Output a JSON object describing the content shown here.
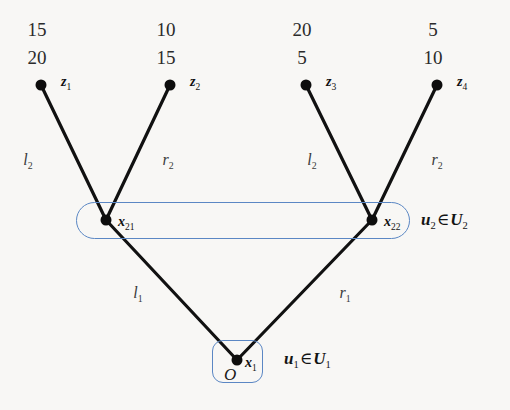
{
  "figure": {
    "background_color": "#f8f7f5",
    "edge_color": "#111111",
    "node_color": "#0d0d0d",
    "group_outline_color": "#5b87c4"
  },
  "leaves": [
    {
      "id": "z1",
      "name": "z",
      "index": "1",
      "x": 41,
      "y": 85,
      "weight_top": "15",
      "weight_bottom": "20"
    },
    {
      "id": "z2",
      "name": "z",
      "index": "2",
      "x": 170,
      "y": 85,
      "weight_top": "10",
      "weight_bottom": "15"
    },
    {
      "id": "z3",
      "name": "z",
      "index": "3",
      "x": 306,
      "y": 85,
      "weight_top": "20",
      "weight_bottom": "5"
    },
    {
      "id": "z4",
      "name": "z",
      "index": "4",
      "x": 437,
      "y": 85,
      "weight_top": "5",
      "weight_bottom": "10"
    }
  ],
  "inner_nodes": [
    {
      "id": "x21",
      "name": "x",
      "index": "21",
      "x": 106,
      "y": 220
    },
    {
      "id": "x22",
      "name": "x",
      "index": "22",
      "x": 372,
      "y": 220
    }
  ],
  "root": {
    "id": "x1",
    "name": "x",
    "index": "1",
    "origin_label": "O",
    "x": 237,
    "y": 360
  },
  "edge_labels": [
    {
      "id": "l2-a",
      "name": "l",
      "index": "2",
      "x": 28,
      "y": 152
    },
    {
      "id": "r2-a",
      "name": "r",
      "index": "2",
      "x": 168,
      "y": 152
    },
    {
      "id": "l2-b",
      "name": "l",
      "index": "2",
      "x": 312,
      "y": 152
    },
    {
      "id": "r2-b",
      "name": "r",
      "index": "2",
      "x": 437,
      "y": 152
    },
    {
      "id": "l1",
      "name": "l",
      "index": "1",
      "x": 138,
      "y": 285
    },
    {
      "id": "r1",
      "name": "r",
      "index": "1",
      "x": 345,
      "y": 285
    }
  ],
  "group_labels": [
    {
      "id": "u2",
      "element": "u",
      "element_index": "2",
      "operator": "∈",
      "set": "U",
      "set_index": "2",
      "x": 421,
      "y": 211
    },
    {
      "id": "u1",
      "element": "u",
      "element_index": "1",
      "operator": "∈",
      "set": "U",
      "set_index": "1",
      "x": 284,
      "y": 350
    }
  ],
  "edges": [
    {
      "id": "edge-x21-z1",
      "from": "x21",
      "to": "z1"
    },
    {
      "id": "edge-x21-z2",
      "from": "x21",
      "to": "z2"
    },
    {
      "id": "edge-x22-z3",
      "from": "x22",
      "to": "z3"
    },
    {
      "id": "edge-x22-z4",
      "from": "x22",
      "to": "z4"
    },
    {
      "id": "edge-x1-x21",
      "from": "x1",
      "to": "x21"
    },
    {
      "id": "edge-x1-x22",
      "from": "x1",
      "to": "x22"
    }
  ]
}
